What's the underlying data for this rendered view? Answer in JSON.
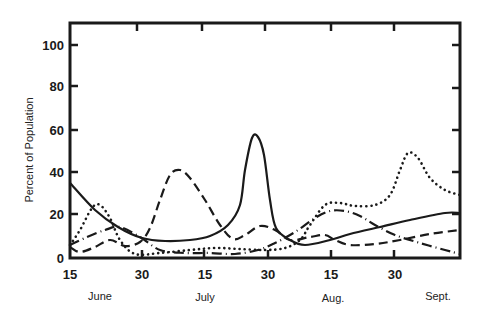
{
  "chart_data": {
    "type": "line",
    "title": "",
    "xlabel": "",
    "ylabel": "Percent of Population",
    "ylim": [
      0,
      100
    ],
    "yticks": [
      0,
      20,
      40,
      60,
      80,
      100
    ],
    "xticks": [
      "15",
      "30",
      "15",
      "30",
      "15",
      "30"
    ],
    "months": [
      "June",
      "July",
      "Aug.",
      "Sept."
    ],
    "x_range": [
      "June 15",
      "Sept. 14"
    ],
    "grid": false,
    "legend": null,
    "series": [
      {
        "name": "solid",
        "style": "solid",
        "points": [
          [
            "Jun 15",
            35
          ],
          [
            "Jun 21",
            22
          ],
          [
            "Jun 26",
            15
          ],
          [
            "Jun 30",
            9
          ],
          [
            "Jul 5",
            8
          ],
          [
            "Jul 12",
            8
          ],
          [
            "Jul 16",
            10
          ],
          [
            "Jul 20",
            15
          ],
          [
            "Jul 23",
            25
          ],
          [
            "Jul 24",
            42
          ],
          [
            "Jul 26",
            56
          ],
          [
            "Jul 27",
            57
          ],
          [
            "Jul 29",
            48
          ],
          [
            "Jul 30",
            27
          ],
          [
            "Aug 1",
            14
          ],
          [
            "Aug 4",
            8
          ],
          [
            "Aug 8",
            6
          ],
          [
            "Aug 14",
            8
          ],
          [
            "Aug 19",
            11
          ],
          [
            "Aug 26",
            15
          ],
          [
            "Sep 2",
            18
          ],
          [
            "Sep 10",
            21
          ],
          [
            "Sep 14",
            21
          ]
        ],
        "px": [
          [
            70,
            183
          ],
          [
            95,
            210
          ],
          [
            118,
            227
          ],
          [
            142,
            238
          ],
          [
            165,
            241
          ],
          [
            190,
            240
          ],
          [
            210,
            236
          ],
          [
            228,
            225
          ],
          [
            240,
            205
          ],
          [
            245,
            170
          ],
          [
            252,
            138
          ],
          [
            258,
            137
          ],
          [
            264,
            155
          ],
          [
            270,
            200
          ],
          [
            276,
            228
          ],
          [
            290,
            240
          ],
          [
            305,
            245
          ],
          [
            330,
            240
          ],
          [
            350,
            234
          ],
          [
            380,
            227
          ],
          [
            410,
            220
          ],
          [
            445,
            213
          ],
          [
            460,
            213
          ]
        ]
      },
      {
        "name": "dashed",
        "style": "dashed",
        "points": [
          [
            "Jun 15",
            5
          ],
          [
            "Jun 17",
            3
          ],
          [
            "Jun 21",
            5
          ],
          [
            "Jun 25",
            8
          ],
          [
            "Jun 28",
            6
          ],
          [
            "Jun 30",
            8
          ],
          [
            "Jul 2",
            14
          ],
          [
            "Jul 5",
            27
          ],
          [
            "Jul 7",
            39
          ],
          [
            "Jul 10",
            41
          ],
          [
            "Jul 12",
            37
          ],
          [
            "Jul 15",
            27
          ],
          [
            "Jul 19",
            15
          ],
          [
            "Jul 22",
            9
          ],
          [
            "Jul 25",
            11
          ],
          [
            "Jul 29",
            15
          ],
          [
            "Aug 1",
            13
          ],
          [
            "Aug 5",
            8
          ],
          [
            "Aug 10",
            10
          ],
          [
            "Aug 13",
            11
          ],
          [
            "Aug 16",
            8
          ],
          [
            "Aug 20",
            6
          ],
          [
            "Aug 26",
            6
          ],
          [
            "Sep 1",
            8
          ],
          [
            "Sep 8",
            11
          ],
          [
            "Sep 14",
            13
          ]
        ],
        "px": [
          [
            70,
            247
          ],
          [
            80,
            252
          ],
          [
            95,
            247
          ],
          [
            110,
            240
          ],
          [
            125,
            246
          ],
          [
            140,
            242
          ],
          [
            150,
            228
          ],
          [
            160,
            200
          ],
          [
            170,
            175
          ],
          [
            180,
            170
          ],
          [
            190,
            178
          ],
          [
            205,
            200
          ],
          [
            220,
            225
          ],
          [
            233,
            239
          ],
          [
            245,
            235
          ],
          [
            260,
            226
          ],
          [
            275,
            230
          ],
          [
            290,
            240
          ],
          [
            310,
            237
          ],
          [
            325,
            235
          ],
          [
            335,
            240
          ],
          [
            350,
            245
          ],
          [
            375,
            244
          ],
          [
            400,
            240
          ],
          [
            430,
            234
          ],
          [
            460,
            230
          ]
        ]
      },
      {
        "name": "dotted",
        "style": "dotted",
        "points": [
          [
            "Jun 15",
            6
          ],
          [
            "Jun 17",
            13
          ],
          [
            "Jun 20",
            23
          ],
          [
            "Jun 22",
            25
          ],
          [
            "Jun 24",
            19
          ],
          [
            "Jun 27",
            8
          ],
          [
            "Jun 30",
            2
          ],
          [
            "Jul 5",
            2
          ],
          [
            "Jul 11",
            4
          ],
          [
            "Jul 17",
            5
          ],
          [
            "Jul 23",
            4
          ],
          [
            "Jul 29",
            4
          ],
          [
            "Aug 3",
            5
          ],
          [
            "Aug 6",
            8
          ],
          [
            "Aug 9",
            15
          ],
          [
            "Aug 13",
            25
          ],
          [
            "Aug 16",
            26
          ],
          [
            "Aug 20",
            24
          ],
          [
            "Aug 24",
            25
          ],
          [
            "Aug 28",
            30
          ],
          [
            "Aug 31",
            41
          ],
          [
            "Sep 2",
            49
          ],
          [
            "Sep 4",
            47
          ],
          [
            "Sep 7",
            38
          ],
          [
            "Sep 11",
            32
          ],
          [
            "Sep 14",
            30
          ]
        ],
        "px": [
          [
            70,
            245
          ],
          [
            80,
            230
          ],
          [
            92,
            208
          ],
          [
            100,
            205
          ],
          [
            110,
            218
          ],
          [
            120,
            240
          ],
          [
            135,
            254
          ],
          [
            160,
            253
          ],
          [
            190,
            250
          ],
          [
            215,
            248
          ],
          [
            240,
            249
          ],
          [
            265,
            250
          ],
          [
            285,
            248
          ],
          [
            300,
            240
          ],
          [
            310,
            225
          ],
          [
            325,
            205
          ],
          [
            340,
            203
          ],
          [
            355,
            206
          ],
          [
            375,
            205
          ],
          [
            390,
            195
          ],
          [
            400,
            170
          ],
          [
            408,
            153
          ],
          [
            418,
            158
          ],
          [
            430,
            178
          ],
          [
            445,
            190
          ],
          [
            460,
            195
          ]
        ]
      },
      {
        "name": "dash-dot",
        "style": "dash-dot",
        "points": [
          [
            "Jun 15",
            6
          ],
          [
            "Jun 18",
            9
          ],
          [
            "Jun 23",
            13
          ],
          [
            "Jun 26",
            15
          ],
          [
            "Jun 30",
            10
          ],
          [
            "Jul 4",
            4
          ],
          [
            "Jul 10",
            2
          ],
          [
            "Jul 16",
            2
          ],
          [
            "Jul 22",
            2
          ],
          [
            "Jul 27",
            4
          ],
          [
            "Jul 31",
            7
          ],
          [
            "Aug 5",
            12
          ],
          [
            "Aug 10",
            19
          ],
          [
            "Aug 14",
            22
          ],
          [
            "Aug 17",
            22
          ],
          [
            "Aug 21",
            20
          ],
          [
            "Aug 24",
            16
          ],
          [
            "Aug 29",
            11
          ],
          [
            "Sep 4",
            7
          ],
          [
            "Sep 10",
            4
          ],
          [
            "Sep 14",
            2
          ]
        ],
        "px": [
          [
            70,
            245
          ],
          [
            85,
            238
          ],
          [
            105,
            230
          ],
          [
            120,
            227
          ],
          [
            140,
            237
          ],
          [
            160,
            250
          ],
          [
            185,
            253
          ],
          [
            210,
            253
          ],
          [
            235,
            254
          ],
          [
            258,
            250
          ],
          [
            275,
            243
          ],
          [
            295,
            232
          ],
          [
            315,
            218
          ],
          [
            330,
            211
          ],
          [
            345,
            211
          ],
          [
            360,
            216
          ],
          [
            375,
            225
          ],
          [
            395,
            235
          ],
          [
            420,
            243
          ],
          [
            445,
            250
          ],
          [
            460,
            254
          ]
        ]
      }
    ]
  },
  "axes": {
    "y_title": "Percent of Population",
    "y_tick_labels": [
      "100",
      "80",
      "60",
      "40",
      "20",
      "0"
    ],
    "x_tick_labels": [
      "15",
      "30",
      "15",
      "30",
      "15",
      "30"
    ],
    "month_labels": [
      "June",
      "July",
      "Aug.",
      "Sept."
    ]
  },
  "colors": {
    "ink": "#1a1a1a",
    "background": "#ffffff"
  }
}
